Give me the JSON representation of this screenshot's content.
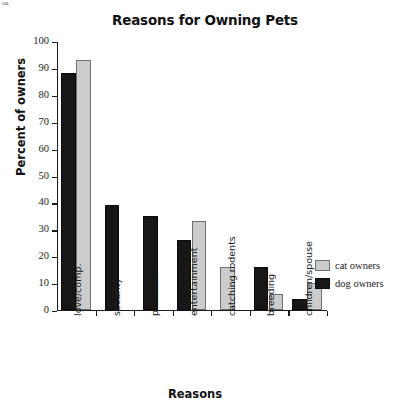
{
  "artifact": {
    "text": "oa."
  },
  "chart_data": {
    "type": "bar",
    "title": "Reasons for Owning Pets",
    "xlabel": "Reasons",
    "ylabel": "Percent of owners",
    "ylim": [
      0,
      100
    ],
    "ytick_step": 10,
    "yticks": [
      0,
      10,
      20,
      30,
      40,
      50,
      60,
      70,
      80,
      90,
      100
    ],
    "grid": false,
    "legend_position": "right-middle",
    "categories": [
      "love/comp.",
      "security",
      "protection",
      "entertainment",
      "catching rodents",
      "breeding",
      "children/spouse"
    ],
    "series": [
      {
        "name": "dog owners",
        "color": "#171717",
        "values": [
          88,
          39,
          35,
          26,
          null,
          16,
          4
        ]
      },
      {
        "name": "cat owners",
        "color": "#cccccc",
        "values": [
          93,
          null,
          null,
          33,
          16,
          6,
          10
        ]
      }
    ]
  }
}
